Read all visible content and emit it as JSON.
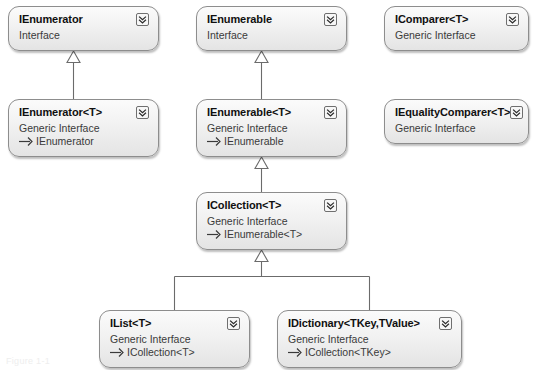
{
  "diagram": {
    "caption": "Figure 1-1",
    "colors": {
      "box_border": "#8d8d8d",
      "box_fill_top": "#fbfbfb",
      "box_fill_bottom": "#e4e4e4",
      "edge": "#6b6b6b",
      "title_text": "#101010",
      "body_text": "#3a3a3a",
      "background": "#ffffff"
    },
    "icon_name": "expand-chevrons-icon",
    "stereotype_interface": "Interface",
    "stereotype_generic_interface": "Generic Interface",
    "nodes": [
      {
        "id": "ienumerator",
        "title": "IEnumerator",
        "subtitle": "Interface",
        "base": null,
        "x": 8,
        "y": 6,
        "w": 151,
        "h": 45
      },
      {
        "id": "ienumerable",
        "title": "IEnumerable",
        "subtitle": "Interface",
        "base": null,
        "x": 196,
        "y": 6,
        "w": 151,
        "h": 45
      },
      {
        "id": "icomparer",
        "title": "IComparer<T>",
        "subtitle": "Generic Interface",
        "base": null,
        "x": 384,
        "y": 6,
        "w": 145,
        "h": 45
      },
      {
        "id": "ienumerator_t",
        "title": "IEnumerator<T>",
        "subtitle": "Generic Interface",
        "base": "IEnumerator",
        "x": 8,
        "y": 99,
        "w": 151,
        "h": 58
      },
      {
        "id": "ienumerable_t",
        "title": "IEnumerable<T>",
        "subtitle": "Generic Interface",
        "base": "IEnumerable",
        "x": 196,
        "y": 99,
        "w": 151,
        "h": 58
      },
      {
        "id": "iequalitycomparer",
        "title": "IEqualityComparer<T>",
        "subtitle": "Generic Interface",
        "base": null,
        "x": 384,
        "y": 99,
        "w": 145,
        "h": 45
      },
      {
        "id": "icollection_t",
        "title": "ICollection<T>",
        "subtitle": "Generic Interface",
        "base": "IEnumerable<T>",
        "x": 196,
        "y": 192,
        "w": 151,
        "h": 58
      },
      {
        "id": "ilist_t",
        "title": "IList<T>",
        "subtitle": "Generic Interface",
        "base": "ICollection<T>",
        "x": 99,
        "y": 310,
        "w": 151,
        "h": 58
      },
      {
        "id": "idictionary",
        "title": "IDictionary<TKey,TValue>",
        "subtitle": "Generic Interface",
        "base": "ICollection<TKey>",
        "x": 277,
        "y": 310,
        "w": 185,
        "h": 58
      }
    ],
    "edges": [
      {
        "id": "e1",
        "from": "ienumerator_t",
        "to": "ienumerator",
        "kind": "generalization"
      },
      {
        "id": "e2",
        "from": "ienumerable_t",
        "to": "ienumerable",
        "kind": "generalization"
      },
      {
        "id": "e3",
        "from": "icollection_t",
        "to": "ienumerable_t",
        "kind": "generalization"
      },
      {
        "id": "e4",
        "from": "ilist_t",
        "to": "icollection_t",
        "kind": "generalization"
      },
      {
        "id": "e5",
        "from": "idictionary",
        "to": "icollection_t",
        "kind": "generalization"
      }
    ]
  }
}
